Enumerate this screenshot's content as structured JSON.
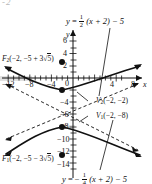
{
  "figure": {
    "type": "hyperbola-graph",
    "center": [
      -2,
      -5
    ],
    "orientation": "vertical-transverse-axis",
    "partial_top_text": "-2"
  },
  "equations": {
    "asymptote_top": {
      "lhs": "y",
      "eq": "=",
      "frac_num": "1",
      "frac_den": "2",
      "rest": "(x + 2) − 5",
      "full": "y = 1/2 (x + 2) − 5"
    },
    "asymptote_bottom": {
      "lhs": "y",
      "eq": "= −",
      "frac_num": "1",
      "frac_den": "4",
      "rest": "(x + 2) − 5",
      "full": "y = −1/4 (x + 2) − 5"
    }
  },
  "point_labels": {
    "focus_upper": {
      "name": "F",
      "sub": "2",
      "open": "(−2, −5 + 3",
      "radicand": "5",
      "close": ")",
      "full": "F2(−2, −5 + 3√5)",
      "coords": [
        -2,
        1.708
      ]
    },
    "focus_lower": {
      "name": "F",
      "sub": "1",
      "open": "(−2, −5 − 3",
      "radicand": "5",
      "close": ")",
      "full": "F1(−2, −5 − 3√5)",
      "coords": [
        -2,
        -11.708
      ]
    },
    "vertex_upper": {
      "name": "V",
      "sub": "2",
      "text": "(−2, −2)",
      "full": "V2(−2, −2)",
      "coords": [
        -2,
        -2
      ]
    },
    "vertex_lower": {
      "name": "V",
      "sub": "1",
      "text": "(−2, −8)",
      "full": "V1(−2, −8)",
      "coords": [
        -2,
        -8
      ]
    }
  },
  "axes": {
    "x_axis_name": "x",
    "y_axis_name": "y",
    "origin_label": "0",
    "x_ticks": [
      "−12",
      "−8",
      "−4",
      "4",
      "8"
    ],
    "y_ticks_positive": [
      "6",
      "4",
      "2"
    ],
    "y_ticks_negative": [
      "−4",
      "−6",
      "−8",
      "−10",
      "−12",
      "−14"
    ],
    "x_range": [
      -14,
      10
    ],
    "y_range": [
      -15,
      7
    ]
  },
  "colors": {
    "ink": "#111111",
    "axis": "#111111",
    "highlight_band": "#c9c9c9",
    "faded": "#b9b9b9",
    "background": "#ffffff"
  }
}
